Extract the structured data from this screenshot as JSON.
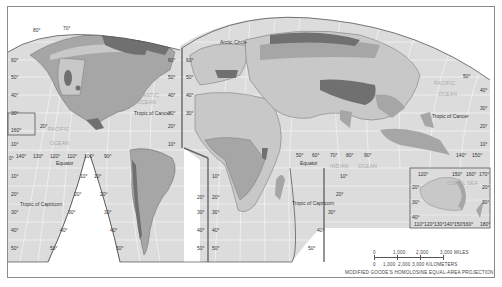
{
  "map": {
    "projection_label": "MODIFIED GOODE'S HOMOLOSINE EQUAL-AREA PROJECTION",
    "colors": {
      "ocean": "#dcdcdc",
      "grid": "#f4f4f4",
      "land_light": "#c8c8c8",
      "land_medium": "#a6a6a6",
      "land_dark": "#707070",
      "interrupt_line": "#666666",
      "border": "#555555",
      "background": "#ffffff"
    },
    "features": {
      "arctic_circle": "Arctic Circle",
      "tropic_cancer_west": "Tropic of Cancer",
      "tropic_cancer_east": "Tropic of Cancer",
      "tropic_capricorn_west": "Tropic of Capricorn",
      "tropic_capricorn_east": "Tropic of Capricorn",
      "equator_west": "Equator",
      "equator_east": "Equator"
    },
    "oceans": {
      "atlantic_1": "ATLANTIC",
      "atlantic_2": "OCEAN",
      "pacific_w_1": "PACIFIC",
      "pacific_w_2": "OCEAN",
      "pacific_e_1": "PACIFIC",
      "pacific_e_2": "OCEAN",
      "indian_1": "INDIAN",
      "indian_2": "OCEAN",
      "coral_sea": "CORAL SEA",
      "arabian_sea": "ARABIAN SEA",
      "bay_of_bengal": "BAY OF BENGAL"
    },
    "lat_labels_left": [
      "60°",
      "50°",
      "40°",
      "30°",
      "20°",
      "10°",
      "0°",
      "10°",
      "20°",
      "30°",
      "40°",
      "50°"
    ],
    "lon_labels_equator_west": [
      "140°",
      "130°",
      "120°",
      "110°",
      "100°",
      "90°"
    ],
    "lon_labels_equator_east": [
      "50°",
      "60°",
      "70°",
      "80°",
      "90°"
    ],
    "lon_labels_east_far": [
      "140°",
      "150°"
    ],
    "inset_hawaii_label": "160°",
    "north_pole_labels": [
      "80°",
      "70°",
      "60°"
    ],
    "australia_inset": {
      "top_lon": [
        "120°",
        "150°",
        "160°",
        "170°"
      ],
      "bottom_lon": [
        "110°",
        "120°",
        "130°",
        "140°",
        "150°",
        "160°",
        "180°"
      ],
      "lat_left": [
        "20°",
        "30°",
        "40°"
      ],
      "lat_right": [
        "20°",
        "30°"
      ]
    },
    "scale": {
      "miles_ticks": [
        "0",
        "1,000",
        "2,000",
        "3,000 MILES"
      ],
      "km_ticks": [
        "0",
        "1,000",
        "2,000",
        "3,000 KILOMETERS"
      ]
    }
  }
}
